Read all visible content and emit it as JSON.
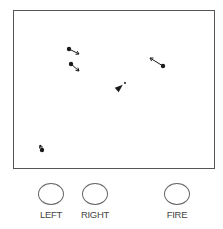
{
  "game": {
    "arena": {
      "left": 13,
      "top": 10,
      "right": 214,
      "bottom": 168,
      "border_color": "#555555"
    },
    "player": {
      "name": "player-ship",
      "x": 118,
      "y": 87,
      "heading_deg": -40,
      "bullet": {
        "x": 124,
        "y": 82
      }
    },
    "enemies": [
      {
        "id": 1,
        "x": 68,
        "y": 48,
        "dir_to": [
          78,
          53
        ]
      },
      {
        "id": 2,
        "x": 70,
        "y": 63,
        "dir_to": [
          78,
          70
        ]
      },
      {
        "id": 3,
        "x": 162,
        "y": 65,
        "dir_to": [
          149,
          57
        ]
      },
      {
        "id": 4,
        "x": 41,
        "y": 149,
        "dir_to": [
          39,
          144
        ]
      }
    ]
  },
  "controls": {
    "left_label": "LEFT",
    "right_label": "RIGHT",
    "fire_label": "FIRE"
  },
  "colors": {
    "ink": "#1a1a1a",
    "outline": "#666666",
    "text": "#444444",
    "background": "#ffffff"
  }
}
